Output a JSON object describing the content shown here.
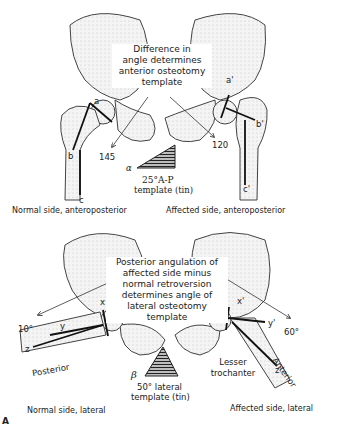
{
  "top_panel": {
    "callout": [
      "Difference in",
      "angle determines",
      "anterior osteotomy",
      "template"
    ],
    "left_caption": "Normal side, anteroposterior",
    "right_caption": "Affected side, anteroposterior",
    "angle_left": "145",
    "angle_right": "120",
    "template_symbol": "α",
    "template_label_1": "25°A-P",
    "template_label_2": "template (tin)",
    "points_left": {
      "a": "a",
      "b": "b",
      "c": "c"
    },
    "points_right": {
      "a": "a'",
      "b": "b'",
      "c": "c'"
    }
  },
  "bottom_panel": {
    "callout": [
      "Posterior angulation of",
      "affected side minus",
      "normal retroversion",
      "determines angle of",
      "lateral osteotomy",
      "template"
    ],
    "left_caption": "Normal side, lateral",
    "right_caption": "Affected side, lateral",
    "angle_left": "10°",
    "angle_right": "60°",
    "template_symbol": "β",
    "template_label_1": "50° lateral",
    "template_label_2": "template (tin)",
    "posterior_label": "Posterior",
    "anterior_label": "Anterior",
    "lesser_trochanter_label": [
      "Lesser",
      "trochanter"
    ],
    "points_left": {
      "x": "x",
      "y": "y",
      "z": "z"
    },
    "points_right": {
      "x": "x'",
      "y": "y'",
      "z": "z'"
    }
  },
  "figure_label": "A"
}
